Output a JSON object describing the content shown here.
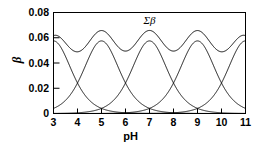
{
  "chart_data": {
    "type": "line",
    "title": "",
    "xlabel": "pH",
    "ylabel": "β",
    "xlim": [
      3,
      11
    ],
    "ylim": [
      0,
      0.08
    ],
    "xticks": [
      3,
      4,
      5,
      6,
      7,
      8,
      9,
      10,
      11
    ],
    "xtick_labels": [
      "3",
      "4",
      "5",
      "6",
      "7",
      "8",
      "9",
      "10",
      "11"
    ],
    "yticks": [
      0,
      0.02,
      0.04,
      0.06,
      0.08
    ],
    "ytick_labels": [
      "0",
      "0.02",
      "0.04",
      "0.06",
      "0.08"
    ],
    "grid": false,
    "legend": "none",
    "annotations": [
      {
        "text": "Σβ",
        "x": 7.0,
        "y": 0.0705
      }
    ],
    "model": {
      "description": "Five individual buffer capacity curves (bell-shaped, centered at pKa values) plus their sum",
      "peak_beta": 0.0575,
      "centers": [
        3,
        5,
        7,
        9,
        11
      ],
      "shape": "sech2",
      "width_decades": 1.0
    },
    "series": [
      {
        "name": "buffer-1",
        "center_pH": 3,
        "peak": 0.0575,
        "x": [
          3,
          3.5,
          4,
          4.5,
          5,
          5.5,
          6,
          6.5,
          7,
          7.5,
          8,
          8.5,
          9,
          9.5,
          10,
          10.5,
          11
        ],
        "values": [
          0.0575,
          0.0467,
          0.0268,
          0.0126,
          0.0053,
          0.0021,
          0.0008,
          0.0003,
          0.0001,
          0.0,
          0.0,
          0.0,
          0.0,
          0.0,
          0.0,
          0.0,
          0.0
        ]
      },
      {
        "name": "buffer-2",
        "center_pH": 5,
        "peak": 0.0575,
        "x": [
          3,
          3.5,
          4,
          4.5,
          5,
          5.5,
          6,
          6.5,
          7,
          7.5,
          8,
          8.5,
          9,
          9.5,
          10,
          10.5,
          11
        ],
        "values": [
          0.0053,
          0.0126,
          0.0268,
          0.0467,
          0.0575,
          0.0467,
          0.0268,
          0.0126,
          0.0053,
          0.0021,
          0.0008,
          0.0003,
          0.0001,
          0.0,
          0.0,
          0.0,
          0.0
        ]
      },
      {
        "name": "buffer-3",
        "center_pH": 7,
        "peak": 0.0575,
        "x": [
          3,
          3.5,
          4,
          4.5,
          5,
          5.5,
          6,
          6.5,
          7,
          7.5,
          8,
          8.5,
          9,
          9.5,
          10,
          10.5,
          11
        ],
        "values": [
          0.0001,
          0.0003,
          0.0008,
          0.0021,
          0.0053,
          0.0126,
          0.0268,
          0.0467,
          0.0575,
          0.0467,
          0.0268,
          0.0126,
          0.0053,
          0.0021,
          0.0008,
          0.0003,
          0.0001
        ]
      },
      {
        "name": "buffer-4",
        "center_pH": 9,
        "peak": 0.0575,
        "x": [
          3,
          3.5,
          4,
          4.5,
          5,
          5.5,
          6,
          6.5,
          7,
          7.5,
          8,
          8.5,
          9,
          9.5,
          10,
          10.5,
          11
        ],
        "values": [
          0.0,
          0.0,
          0.0,
          0.0,
          0.0001,
          0.0003,
          0.0008,
          0.0021,
          0.0053,
          0.0126,
          0.0268,
          0.0467,
          0.0575,
          0.0467,
          0.0268,
          0.0126,
          0.0053
        ]
      },
      {
        "name": "buffer-5",
        "center_pH": 11,
        "peak": 0.0575,
        "x": [
          3,
          3.5,
          4,
          4.5,
          5,
          5.5,
          6,
          6.5,
          7,
          7.5,
          8,
          8.5,
          9,
          9.5,
          10,
          10.5,
          11
        ],
        "values": [
          0.0,
          0.0,
          0.0,
          0.0,
          0.0,
          0.0,
          0.0001,
          0.0003,
          0.0008,
          0.0021,
          0.0053,
          0.0126,
          0.0268,
          0.0467,
          0.0575,
          0.0467,
          0.0575
        ]
      },
      {
        "name": "Σβ",
        "is_sum": true,
        "x": [
          3,
          3.5,
          4,
          4.5,
          5,
          5.5,
          6,
          6.5,
          7,
          7.5,
          8,
          8.5,
          9,
          9.5,
          10,
          10.5,
          11
        ],
        "values": [
          0.061,
          0.0596,
          0.0544,
          0.0614,
          0.061,
          0.0614,
          0.0544,
          0.0615,
          0.061,
          0.0615,
          0.0544,
          0.0614,
          0.061,
          0.0614,
          0.0544,
          0.0596,
          0.061
        ],
        "min": 0.04,
        "max": 0.0615
      }
    ]
  },
  "axes": {
    "y_label": "β",
    "x_label": "pH",
    "sum_label": "Σβ"
  }
}
